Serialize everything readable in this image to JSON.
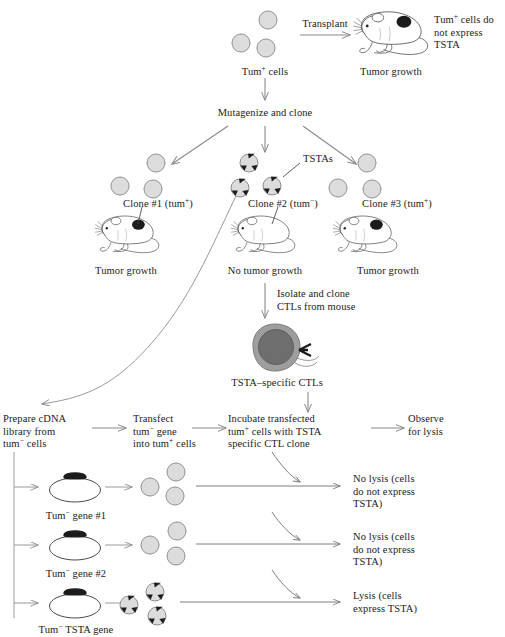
{
  "figure": {
    "type": "biology-experiment-flow-diagram",
    "background_color": "#ffffff",
    "ink_color": "#1a1a1a",
    "arrow_color": "#8a8a8a",
    "cell_fill": "#dcdcdc",
    "cell_stroke": "#8c8c8c",
    "tsta_spike_color": "#1c1c1c",
    "ctl_cytoplasm": "#9e9e9e",
    "ctl_nucleus": "#6e6e6e",
    "tumor_spot_color": "#1c1c1c",
    "gene_insert_color": "#1c1c1c"
  },
  "top": {
    "source_cells_label_main": "Tum",
    "source_cells_label_sup": "+",
    "source_cells_label_tail": " cells",
    "transplant_arrow_label": "Transplant",
    "tumor_growth_label": "Tumor growth",
    "annotation_line1_main": "Tum",
    "annotation_line1_sup": "+",
    "annotation_line1_tail": " cells do",
    "annotation_line2": "not express",
    "annotation_line3": "TSTA",
    "mutagenize_label": "Mutagenize and clone"
  },
  "clones": [
    {
      "name": "clone-1",
      "label_main": "Clone #1 (tum",
      "label_sup": "+",
      "label_tail": ")",
      "outcome": "Tumor growth",
      "has_tsta": false,
      "tumor_present": true,
      "cell_count": 3
    },
    {
      "name": "clone-2",
      "label_main": "Clone #2 (tum",
      "label_sup": "−",
      "label_tail": ")",
      "outcome": "No tumor growth",
      "has_tsta": true,
      "tumor_present": false,
      "cell_count": 3,
      "tsta_callout": "TSTAs"
    },
    {
      "name": "clone-3",
      "label_main": "Clone #3 (tum",
      "label_sup": "+",
      "label_tail": ")",
      "outcome": "Tumor growth",
      "has_tsta": false,
      "tumor_present": true,
      "cell_count": 3
    }
  ],
  "ctl": {
    "isolate_line1": "Isolate and clone",
    "isolate_line2": "CTLs from mouse",
    "ctl_label": "TSTA–specific CTLs"
  },
  "workflow": [
    {
      "name": "prepare-cdna",
      "line1": "Prepare cDNA",
      "line2": "library from",
      "line3_main": "tum",
      "line3_sup": "−",
      "line3_tail": " cells"
    },
    {
      "name": "transfect",
      "line1": "Transfect",
      "line2_italic": "tum",
      "line2_sup": "−",
      "line2_tail": " gene",
      "line3_main": "into tum",
      "line3_sup": "+",
      "line3_tail": " cells"
    },
    {
      "name": "incubate",
      "line1": "Incubate transfected",
      "line2_main": "tum",
      "line2_sup": "+",
      "line2_tail": " cells with TSTA",
      "line3": "specific CTL clone"
    },
    {
      "name": "observe",
      "line1": "Observe",
      "line2": "for lysis"
    }
  ],
  "gene_rows": [
    {
      "name": "tum-gene-1",
      "plasmid_label_italic": "Tum",
      "plasmid_label_sup": "−",
      "plasmid_label_tail": " gene #1",
      "cells_have_tsta": false,
      "result_line1": "No lysis (cells",
      "result_line2": "do not express",
      "result_line3": "TSTA)"
    },
    {
      "name": "tum-gene-2",
      "plasmid_label_italic": "Tum",
      "plasmid_label_sup": "−",
      "plasmid_label_tail": " gene #2",
      "cells_have_tsta": false,
      "result_line1": "No lysis (cells",
      "result_line2": "do not express",
      "result_line3": "TSTA)"
    },
    {
      "name": "tum-tsta-gene",
      "plasmid_label_italic": "Tum",
      "plasmid_label_sup": "−",
      "plasmid_label_tail": " TSTA gene",
      "cells_have_tsta": true,
      "result_line1": "Lysis (cells",
      "result_line2": "express TSTA)",
      "result_line3": ""
    }
  ]
}
